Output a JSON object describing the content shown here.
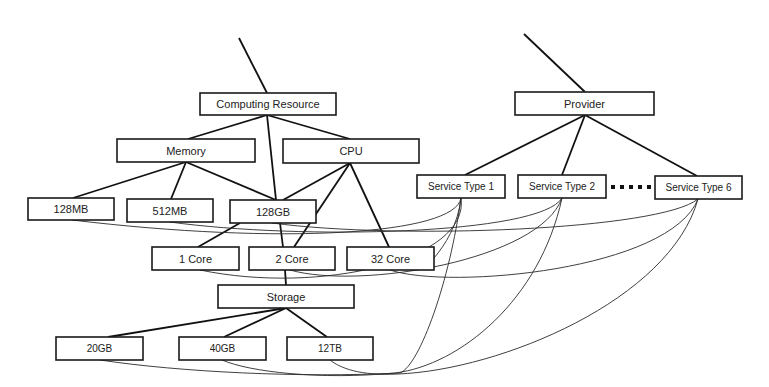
{
  "diagram": {
    "title": "",
    "nodes": {
      "computing_resource": {
        "label": "Computing Resource",
        "x": 200,
        "y": 93,
        "w": 136,
        "h": 22
      },
      "memory": {
        "label": "Memory",
        "x": 117,
        "y": 139,
        "w": 138,
        "h": 23
      },
      "cpu": {
        "label": "CPU",
        "x": 283,
        "y": 139,
        "w": 136,
        "h": 24
      },
      "mem_128mb": {
        "label": "128MB",
        "x": 28,
        "y": 198,
        "w": 86,
        "h": 22
      },
      "mem_512mb": {
        "label": "512MB",
        "x": 127,
        "y": 199,
        "w": 86,
        "h": 23
      },
      "mem_128gb": {
        "label": "128GB",
        "x": 230,
        "y": 200,
        "w": 86,
        "h": 23
      },
      "cpu_1core": {
        "label": "1 Core",
        "x": 152,
        "y": 247,
        "w": 87,
        "h": 23
      },
      "cpu_2core": {
        "label": "2 Core",
        "x": 249,
        "y": 247,
        "w": 86,
        "h": 23
      },
      "cpu_32core": {
        "label": "32 Core",
        "x": 347,
        "y": 247,
        "w": 87,
        "h": 23
      },
      "storage": {
        "label": "Storage",
        "x": 218,
        "y": 285,
        "w": 136,
        "h": 23
      },
      "sto_20gb": {
        "label": "20GB",
        "x": 56,
        "y": 337,
        "w": 87,
        "h": 23
      },
      "sto_40gb": {
        "label": "40GB",
        "x": 179,
        "y": 337,
        "w": 87,
        "h": 23
      },
      "sto_12tb": {
        "label": "12TB",
        "x": 287,
        "y": 337,
        "w": 86,
        "h": 23
      },
      "provider": {
        "label": "Provider",
        "x": 515,
        "y": 92,
        "w": 139,
        "h": 23
      },
      "service_type_1": {
        "label": "Service Type 1",
        "x": 417,
        "y": 175,
        "w": 88,
        "h": 23
      },
      "service_type_2": {
        "label": "Service Type 2",
        "x": 518,
        "y": 175,
        "w": 88,
        "h": 23
      },
      "service_type_6": {
        "label": "Service Type 6",
        "x": 655,
        "y": 176,
        "w": 87,
        "h": 23
      }
    },
    "tree_edges": [
      [
        "computing_resource",
        "memory"
      ],
      [
        "computing_resource",
        "cpu"
      ],
      [
        "computing_resource",
        "mem_128gb"
      ],
      [
        "memory",
        "mem_128mb"
      ],
      [
        "memory",
        "mem_512mb"
      ],
      [
        "memory",
        "mem_128gb"
      ],
      [
        "cpu",
        "mem_128gb"
      ],
      [
        "cpu",
        "cpu_2core"
      ],
      [
        "cpu",
        "cpu_32core"
      ],
      [
        "mem_128gb",
        "cpu_1core"
      ],
      [
        "mem_128gb",
        "cpu_2core"
      ],
      [
        "cpu_2core",
        "storage"
      ],
      [
        "storage",
        "sto_20gb"
      ],
      [
        "storage",
        "sto_40gb"
      ],
      [
        "storage",
        "sto_12tb"
      ],
      [
        "provider",
        "service_type_1"
      ],
      [
        "provider",
        "service_type_2"
      ],
      [
        "provider",
        "service_type_6"
      ]
    ],
    "ellipsis": {
      "between": [
        "service_type_2",
        "service_type_6"
      ],
      "dot_count": 5
    },
    "colors": {
      "stroke": "#111111",
      "background": "#ffffff",
      "text": "#222222"
    }
  }
}
